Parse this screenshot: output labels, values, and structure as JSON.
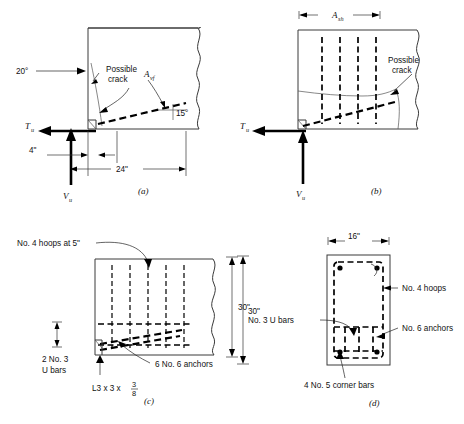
{
  "figure": {
    "panels": [
      {
        "id": "a",
        "id_label": "(a)",
        "labels": {
          "angle_crack": "20°",
          "possible_crack": "Possible\ncrack",
          "possible_crack_line1": "Possible",
          "possible_crack_line2": "crack",
          "avf_main": "A",
          "avf_sub": "vf",
          "angle_avf": "15°",
          "tu_main": "T",
          "tu_sub": "u",
          "vu_main": "V",
          "vu_sub": "u",
          "dim_4in": "4\"",
          "dim_24in": "24\""
        }
      },
      {
        "id": "b",
        "id_label": "(b)",
        "labels": {
          "ash_main": "A",
          "ash_sub": "sh",
          "possible_crack_line1": "Possible",
          "possible_crack_line2": "crack",
          "tu_main": "T",
          "tu_sub": "u",
          "vu_main": "V",
          "vu_sub": "u"
        }
      },
      {
        "id": "c",
        "id_label": "(c)",
        "labels": {
          "hoops": "No. 4 hoops at 5\"",
          "ubars_line1": "2 No. 3",
          "ubars_line2": "U bars",
          "angle_leg": "L3 x 3 x",
          "angle_frac_num": "3",
          "angle_frac_den": "8",
          "anchors": "6 No. 6 anchors",
          "dim_30in": "30\""
        }
      },
      {
        "id": "d",
        "id_label": "(d)",
        "labels": {
          "dim_16in": "16\"",
          "dim_30in": "30\"",
          "hoops": "No. 4 hoops",
          "ubars": "No. 3 U bars",
          "anchors": "No. 6 anchors",
          "corner_bars": "4 No. 5 corner bars"
        }
      }
    ],
    "colors": {
      "line": "#3a3a3a",
      "text": "#111111",
      "heavy": "#000000",
      "background": "#ffffff"
    }
  }
}
